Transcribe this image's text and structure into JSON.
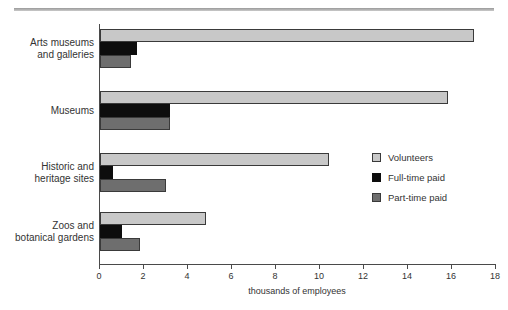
{
  "chart_data": {
    "type": "bar",
    "orientation": "horizontal",
    "title": "",
    "xlabel": "thousands of employees",
    "ylabel": "",
    "xlim": [
      0,
      18
    ],
    "xticks": [
      0,
      2,
      4,
      6,
      8,
      10,
      12,
      14,
      16,
      18
    ],
    "grid": false,
    "legend_position": "middle-right",
    "categories": [
      "Arts museums and galleries",
      "Museums",
      "Historic and heritage sites",
      "Zoos and botanical gardens"
    ],
    "series": [
      {
        "name": "Volunteers",
        "color": "#c8c8c8",
        "values": [
          17.0,
          15.8,
          10.4,
          4.8
        ]
      },
      {
        "name": "Full-time paid",
        "color": "#0d0d0d",
        "values": [
          1.7,
          3.2,
          0.6,
          1.0
        ]
      },
      {
        "name": "Part-time paid",
        "color": "#6e6e6e",
        "values": [
          1.4,
          3.2,
          3.0,
          1.8
        ]
      }
    ]
  },
  "category_lines": [
    [
      "Arts museums",
      "and galleries"
    ],
    [
      "Museums",
      ""
    ],
    [
      "Historic and",
      "heritage sites"
    ],
    [
      "Zoos and",
      "botanical gardens"
    ]
  ]
}
